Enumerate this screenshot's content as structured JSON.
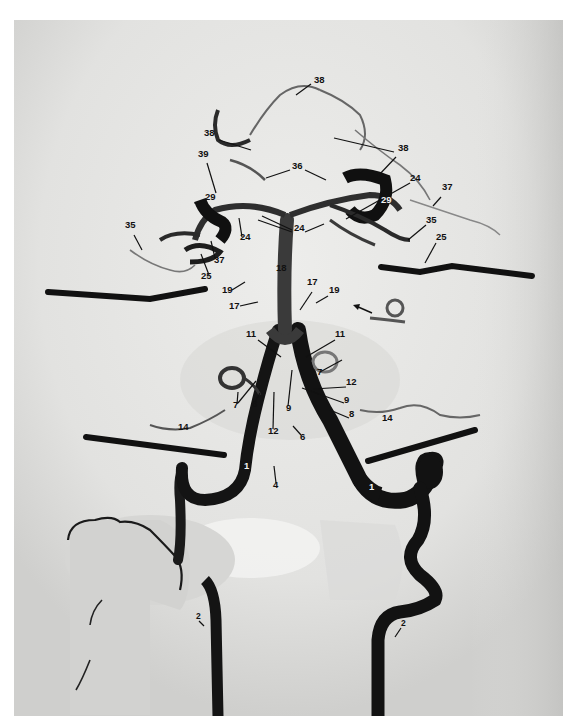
{
  "figure": {
    "type": "vertebral-basilar angiogram",
    "colors": {
      "background": "#e6e6e4",
      "vessel": "#141414",
      "page": "#ffffff"
    }
  },
  "labels": [
    {
      "text": "38",
      "x": 314,
      "y": 80
    },
    {
      "text": "38",
      "x": 204,
      "y": 133
    },
    {
      "text": "38",
      "x": 398,
      "y": 148
    },
    {
      "text": "39",
      "x": 198,
      "y": 154
    },
    {
      "text": "36",
      "x": 292,
      "y": 166
    },
    {
      "text": "24",
      "x": 410,
      "y": 178
    },
    {
      "text": "37",
      "x": 442,
      "y": 187
    },
    {
      "text": "29",
      "x": 205,
      "y": 197
    },
    {
      "text": "29",
      "x": 381,
      "y": 200,
      "white": true
    },
    {
      "text": "24",
      "x": 294,
      "y": 228
    },
    {
      "text": "24",
      "x": 240,
      "y": 237
    },
    {
      "text": "35",
      "x": 125,
      "y": 225
    },
    {
      "text": "35",
      "x": 426,
      "y": 220
    },
    {
      "text": "25",
      "x": 436,
      "y": 237
    },
    {
      "text": "37",
      "x": 214,
      "y": 260
    },
    {
      "text": "18",
      "x": 276,
      "y": 268
    },
    {
      "text": "25",
      "x": 201,
      "y": 276
    },
    {
      "text": "17",
      "x": 307,
      "y": 282
    },
    {
      "text": "19",
      "x": 222,
      "y": 290
    },
    {
      "text": "19",
      "x": 329,
      "y": 290
    },
    {
      "text": "17",
      "x": 229,
      "y": 306
    },
    {
      "text": "11",
      "x": 246,
      "y": 334
    },
    {
      "text": "11",
      "x": 335,
      "y": 334
    },
    {
      "text": "7",
      "x": 317,
      "y": 372
    },
    {
      "text": "12",
      "x": 346,
      "y": 382
    },
    {
      "text": "7",
      "x": 233,
      "y": 405
    },
    {
      "text": "8",
      "x": 252,
      "y": 404
    },
    {
      "text": "9",
      "x": 286,
      "y": 408
    },
    {
      "text": "9",
      "x": 344,
      "y": 400
    },
    {
      "text": "8",
      "x": 349,
      "y": 414
    },
    {
      "text": "12",
      "x": 268,
      "y": 431
    },
    {
      "text": "6",
      "x": 300,
      "y": 437
    },
    {
      "text": "14",
      "x": 178,
      "y": 427
    },
    {
      "text": "14",
      "x": 382,
      "y": 418
    },
    {
      "text": "1",
      "x": 244,
      "y": 466,
      "white": true
    },
    {
      "text": "1",
      "x": 369,
      "y": 487,
      "white": true
    },
    {
      "text": "4",
      "x": 273,
      "y": 485
    },
    {
      "text": "2",
      "x": 196,
      "y": 617,
      "small": true
    },
    {
      "text": "2",
      "x": 401,
      "y": 624,
      "small": true
    }
  ]
}
